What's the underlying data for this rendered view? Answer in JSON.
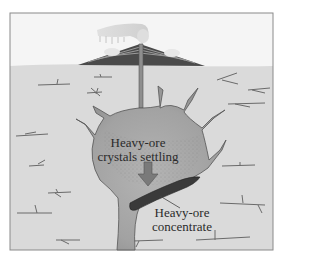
{
  "diagram": {
    "labels": {
      "settling_line1": "Heavy-ore",
      "settling_line2": "crystals settling",
      "concentrate_line1": "Heavy-ore",
      "concentrate_line2": "concentrate"
    },
    "parts": [
      "volcano",
      "eruption-plume",
      "conduit",
      "magma-chamber",
      "dikes",
      "settling-arrow",
      "ore-concentrate",
      "ground-fractures"
    ],
    "colors": {
      "sky": "#f4f4f4",
      "ground": "#d9d9d9",
      "magma": "#9c9c9c",
      "ore": "#3a3a3a",
      "frame": "#8a8a8a",
      "arrow": "#7a7a7a"
    }
  }
}
